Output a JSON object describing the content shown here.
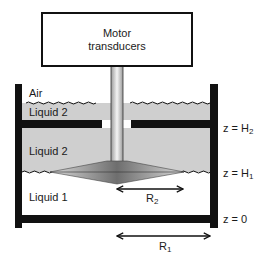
{
  "motor": {
    "line1": "Motor",
    "line2": "transducers"
  },
  "regions": {
    "air": "Air",
    "liquid2_top": "Liquid 2",
    "liquid2_mid": "Liquid 2",
    "liquid1": "Liquid 1"
  },
  "levels": [
    {
      "name": "H2",
      "prefix": "z = H",
      "sub": "2"
    },
    {
      "name": "H1",
      "prefix": "z = H",
      "sub": "1"
    },
    {
      "name": "zero",
      "prefix": "z = 0",
      "sub": ""
    }
  ],
  "radii": [
    {
      "name": "R2",
      "base": "R",
      "sub": "2"
    },
    {
      "name": "R1",
      "base": "R",
      "sub": "1"
    }
  ],
  "colors": {
    "wall": "#111111",
    "liquid2": "#cfcfcf",
    "liquid1": "#ffffff",
    "air": "#ffffff",
    "cone_dark": "#6e6e6e",
    "cone_light": "#d8d8d8"
  }
}
